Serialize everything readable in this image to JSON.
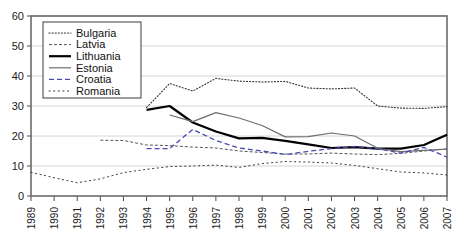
{
  "chart_data": {
    "type": "line",
    "title": "",
    "subtitle": "",
    "xlabel": "",
    "ylabel": "",
    "xlim": [
      1989,
      2007
    ],
    "ylim": [
      0,
      60
    ],
    "ytick_step": 10,
    "yticks": [
      "0",
      "10",
      "20",
      "30",
      "40",
      "50",
      "60"
    ],
    "x": [
      1989,
      1990,
      1991,
      1992,
      1993,
      1994,
      1995,
      1996,
      1997,
      1998,
      1999,
      2000,
      2001,
      2002,
      2003,
      2004,
      2005,
      2006,
      2007
    ],
    "xticks": [
      "1989",
      "1990",
      "1991",
      "1992",
      "1993",
      "1994",
      "1995",
      "1996",
      "1997",
      "1998",
      "1999",
      "2000",
      "2001",
      "2002",
      "2003",
      "2004",
      "2005",
      "2006",
      "2007"
    ],
    "grid": true,
    "grid_axis": "y",
    "legend_position": "top-left",
    "series": [
      {
        "name": "Bulgaria",
        "style": "dotted",
        "color": "#333333",
        "width": 1.1,
        "values": [
          null,
          null,
          null,
          null,
          null,
          29.5,
          37.5,
          35.0,
          39.2,
          38.3,
          38.0,
          38.2,
          36.0,
          35.7,
          36.0,
          30.0,
          29.3,
          29.2,
          29.8
        ]
      },
      {
        "name": "Latvia",
        "style": "dashed-fine",
        "color": "#555555",
        "width": 1.0,
        "values": [
          null,
          null,
          null,
          18.6,
          18.5,
          17.0,
          16.8,
          16.3,
          16.0,
          15.0,
          14.5,
          14.0,
          14.0,
          14.3,
          14.0,
          13.8,
          14.2,
          15.0,
          15.7
        ]
      },
      {
        "name": "Lithuania",
        "style": "solid",
        "color": "#000000",
        "width": 2.2,
        "values": [
          null,
          null,
          null,
          null,
          null,
          28.7,
          30.0,
          24.5,
          21.5,
          19.2,
          19.4,
          18.4,
          17.2,
          16.0,
          16.3,
          15.8,
          15.8,
          17.0,
          20.4
        ]
      },
      {
        "name": "Estonia",
        "style": "solid",
        "color": "#6e6e6e",
        "width": 1.2,
        "values": [
          null,
          null,
          null,
          null,
          null,
          null,
          27.0,
          24.8,
          27.8,
          26.0,
          23.5,
          19.7,
          19.8,
          21.0,
          20.0,
          15.9,
          14.8,
          15.2,
          15.6
        ]
      },
      {
        "name": "Croatia",
        "style": "dashed",
        "color": "#4a4ab4",
        "width": 1.3,
        "values": [
          null,
          null,
          null,
          null,
          null,
          15.8,
          15.8,
          22.2,
          18.5,
          16.0,
          15.0,
          13.8,
          14.9,
          15.8,
          16.5,
          15.8,
          14.3,
          16.2,
          13.0
        ]
      },
      {
        "name": "Romania",
        "style": "dash-dot",
        "color": "#3a3a3a",
        "width": 1.0,
        "values": [
          7.9,
          6.1,
          4.4,
          5.7,
          7.8,
          8.9,
          9.8,
          10.0,
          10.3,
          9.5,
          10.8,
          11.5,
          11.3,
          11.0,
          10.2,
          9.1,
          8.0,
          7.7,
          7.0
        ]
      }
    ]
  },
  "legend": {
    "items": [
      {
        "label": "Bulgaria"
      },
      {
        "label": "Latvia"
      },
      {
        "label": "Lithuania"
      },
      {
        "label": "Estonia"
      },
      {
        "label": "Croatia"
      },
      {
        "label": "Romania"
      }
    ]
  },
  "colors": {
    "plot_border": "#6b6b6b",
    "gridline": "#c9c9c9",
    "background": "#ffffff",
    "legend_border": "#4d4d4d",
    "croatia_accent": "#4a4ab4"
  }
}
